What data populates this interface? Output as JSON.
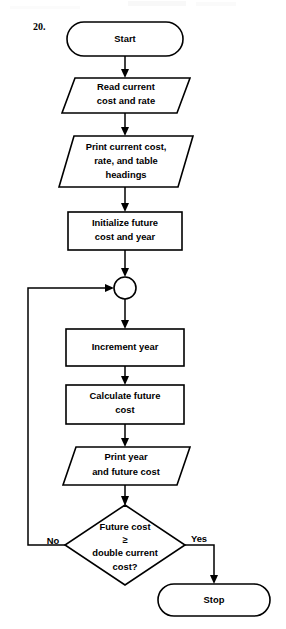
{
  "figure": {
    "item_number": "20.",
    "type": "flowchart"
  },
  "nodes": [
    {
      "id": "start",
      "shape": "terminator",
      "name": "start-terminator",
      "lines": [
        "Start"
      ]
    },
    {
      "id": "read-input",
      "shape": "parallelogram",
      "name": "read-input-node",
      "lines": [
        "Read current",
        "cost and rate"
      ]
    },
    {
      "id": "print-headings",
      "shape": "parallelogram",
      "name": "print-headings-node",
      "lines": [
        "Print current cost,",
        "rate, and table",
        "headings"
      ]
    },
    {
      "id": "initialize",
      "shape": "process",
      "name": "initialize-node",
      "lines": [
        "Initialize future",
        "cost and year"
      ]
    },
    {
      "id": "loop-connector",
      "shape": "connector",
      "name": "loop-connector-node",
      "lines": []
    },
    {
      "id": "increment-year",
      "shape": "process",
      "name": "increment-year-node",
      "lines": [
        "Increment year"
      ]
    },
    {
      "id": "calculate-cost",
      "shape": "process",
      "name": "calculate-future-cost-node",
      "lines": [
        "Calculate future",
        "cost"
      ]
    },
    {
      "id": "print-year-cost",
      "shape": "parallelogram",
      "name": "print-year-and-cost-node",
      "lines": [
        "Print year",
        "and future cost"
      ]
    },
    {
      "id": "decision",
      "shape": "diamond",
      "name": "decision-node",
      "lines": [
        "Future cost",
        "≥",
        "double current",
        "cost?"
      ]
    },
    {
      "id": "stop",
      "shape": "terminator",
      "name": "stop-terminator",
      "lines": [
        "Stop"
      ]
    }
  ],
  "branch_labels": {
    "no": "No",
    "yes": "Yes"
  },
  "colors": {
    "stroke": "#000000",
    "fill": "#ffffff",
    "background": "#ffffff",
    "text": "#000000"
  }
}
